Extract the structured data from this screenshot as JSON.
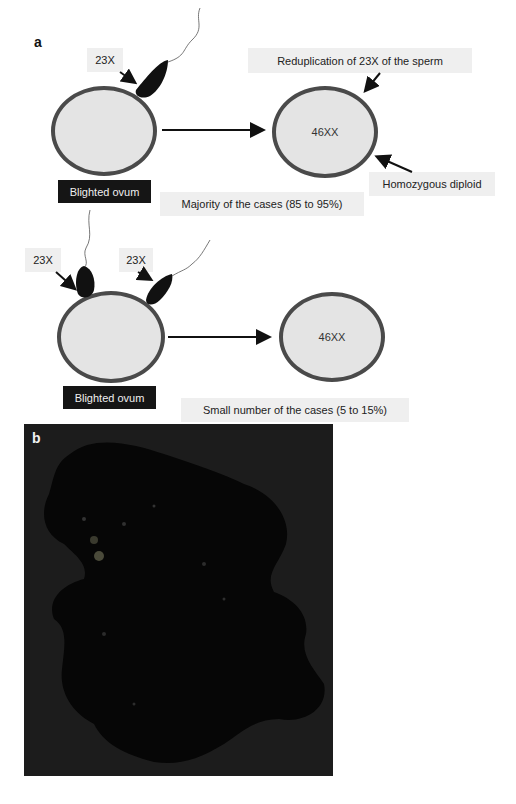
{
  "panel_a": {
    "label": "a",
    "top_row": {
      "sperm_label": "23X",
      "ovum_label": "Blighted ovum",
      "result_cell": "46XX",
      "reduplication_label": "Reduplication of 23X of the sperm",
      "homozygous_label": "Homozygous diploid",
      "caption": "Majority of the cases (85 to 95%)"
    },
    "bottom_row": {
      "sperm_label_1": "23X",
      "sperm_label_2": "23X",
      "ovum_label": "Blighted ovum",
      "result_cell": "46XX",
      "caption": "Small number of the cases (5 to 15%)"
    }
  },
  "panel_b": {
    "label": "b",
    "image_description": "gross specimen photograph of molar tissue on dark background"
  },
  "colors": {
    "cell_fill": "#e4e4e4",
    "cell_border": "#4a4a4a",
    "label_box": "#efefef",
    "dark_box": "#151515",
    "photo_bg": "#1b1b1b"
  }
}
